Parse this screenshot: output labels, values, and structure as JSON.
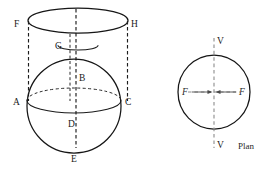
{
  "figure": {
    "title": "",
    "elevation": {
      "name": "sphere-and-cylinder-elevation",
      "labels": {
        "F": "F",
        "H": "H",
        "G": "G",
        "B": "B",
        "A": "A",
        "C": "C",
        "D": "D",
        "E": "E"
      }
    },
    "plan": {
      "name": "plan-view",
      "caption": "Plan",
      "labels": {
        "v_top": "V",
        "v_bottom": "V",
        "f_left": "F",
        "f_right": "F"
      }
    },
    "colors": {
      "ink": "#161616",
      "hidden_line": "#1d1d1d",
      "axis_grey": "#8c8c8c",
      "arrow_grey": "#4a4a4a",
      "background": "#ffffff"
    }
  }
}
